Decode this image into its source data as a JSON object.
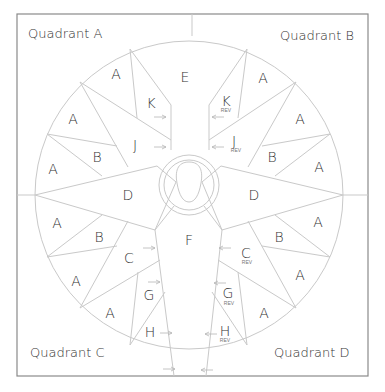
{
  "diagram": {
    "quadrants": {
      "a": "Quadrant A",
      "b": "Quadrant B",
      "c": "Quadrant C",
      "d": "Quadrant D"
    },
    "pieces": {
      "a": "A",
      "b": "B",
      "c": "C",
      "d": "D",
      "e": "E",
      "f": "F",
      "g": "G",
      "h": "H",
      "j": "J",
      "k": "K"
    },
    "rev_label": "REV",
    "colors": {
      "line": "#c9c9c9",
      "frame": "#8a8a8a",
      "text": "#333333"
    }
  }
}
